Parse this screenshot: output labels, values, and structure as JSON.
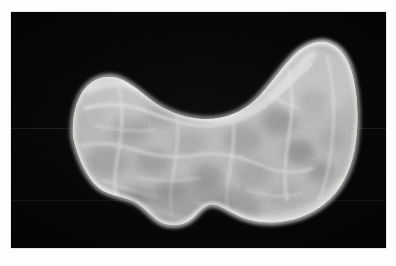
{
  "figure": {
    "kind": "gross-pathology-photograph",
    "subject_label": "Thyroid gland specimen, coronal cut surface",
    "modality": "macroscopic photograph",
    "orientation": "anterior view, superior up",
    "caption": "",
    "dimensions": {
      "width_px": 396,
      "height_px": 266
    }
  },
  "plate": {
    "background_color": "#030303",
    "border_color": "#e9e9e9",
    "frame_color": "#fdfdfd",
    "left_px": 11,
    "top_px": 12,
    "width_px": 375,
    "height_px": 236
  },
  "specimen": {
    "shape": "butterfly / bilobed with central isthmus",
    "surface": "nodular, multilobulated cut surface",
    "septa_color": "#f2f2f0",
    "parenchyma_light": "#c8c8c6",
    "parenchyma_mid": "#9d9d9b",
    "parenchyma_dark": "#6b6b6a",
    "nodule_dark": "#4e4e4d",
    "capsule_color": "#ffffff",
    "regions": [
      {
        "name": "left-lobe",
        "descriptor": "left lobe, nodular"
      },
      {
        "name": "isthmus",
        "descriptor": "central isthmus with inferior protrusion"
      },
      {
        "name": "right-lobe",
        "descriptor": "right lobe, larger, prominently nodular"
      },
      {
        "name": "superior-notch",
        "descriptor": "concave superior border between lobes"
      }
    ],
    "nodules": [
      {
        "cx": 118,
        "cy": 118,
        "rx": 17,
        "ry": 13,
        "tone": "#6f6f6e"
      },
      {
        "cx": 150,
        "cy": 104,
        "rx": 14,
        "ry": 10,
        "tone": "#7a7a79"
      },
      {
        "cx": 96,
        "cy": 150,
        "rx": 19,
        "ry": 14,
        "tone": "#767675"
      },
      {
        "cx": 142,
        "cy": 150,
        "rx": 16,
        "ry": 12,
        "tone": "#6a6a69"
      },
      {
        "cx": 178,
        "cy": 132,
        "rx": 15,
        "ry": 11,
        "tone": "#868685"
      },
      {
        "cx": 196,
        "cy": 162,
        "rx": 14,
        "ry": 11,
        "tone": "#5d5d5c"
      },
      {
        "cx": 232,
        "cy": 128,
        "rx": 17,
        "ry": 13,
        "tone": "#72726f"
      },
      {
        "cx": 243,
        "cy": 160,
        "rx": 16,
        "ry": 13,
        "tone": "#7d7d7b"
      },
      {
        "cx": 268,
        "cy": 110,
        "rx": 15,
        "ry": 12,
        "tone": "#5a5a58"
      },
      {
        "cx": 286,
        "cy": 140,
        "rx": 14,
        "ry": 11,
        "tone": "#4e4e4c"
      },
      {
        "cx": 300,
        "cy": 92,
        "rx": 14,
        "ry": 11,
        "tone": "#6e6e6c"
      },
      {
        "cx": 274,
        "cy": 182,
        "rx": 16,
        "ry": 12,
        "tone": "#8a8a88"
      },
      {
        "cx": 206,
        "cy": 196,
        "rx": 15,
        "ry": 11,
        "tone": "#70706e"
      },
      {
        "cx": 120,
        "cy": 186,
        "rx": 14,
        "ry": 11,
        "tone": "#656563"
      },
      {
        "cx": 82,
        "cy": 104,
        "rx": 13,
        "ry": 10,
        "tone": "#8c8c8a"
      },
      {
        "cx": 320,
        "cy": 128,
        "rx": 12,
        "ry": 10,
        "tone": "#858583"
      }
    ]
  },
  "annotations": {
    "scan_lines_visible": true,
    "text_labels": []
  }
}
